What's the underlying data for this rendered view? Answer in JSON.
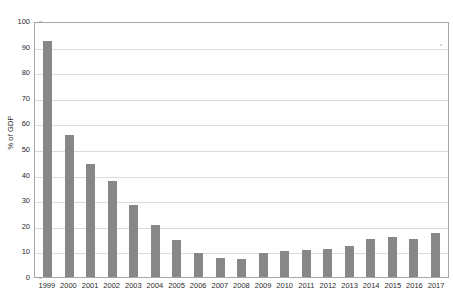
{
  "chart_data": {
    "type": "bar",
    "title": "",
    "xlabel": "",
    "ylabel": "% of GDP",
    "ylim": [
      0,
      100
    ],
    "ytick_step": 10,
    "yticks": [
      0,
      10,
      20,
      30,
      40,
      50,
      60,
      70,
      80,
      90,
      100
    ],
    "grid": true,
    "legend": "none",
    "bar_color": "#878787",
    "gridline_color": "#dcdcdc",
    "axis_color": "#a6a6a6",
    "categories": [
      "1999",
      "2000",
      "2001",
      "2002",
      "2003",
      "2004",
      "2005",
      "2006",
      "2007",
      "2008",
      "2009",
      "2010",
      "2011",
      "2012",
      "2013",
      "2014",
      "2015",
      "2016",
      "2017"
    ],
    "values": [
      92,
      55.5,
      44,
      37.5,
      28,
      20.5,
      14.5,
      9.5,
      7.5,
      7,
      9.5,
      10,
      10.5,
      11,
      12,
      15,
      15.5,
      15,
      17
    ]
  }
}
